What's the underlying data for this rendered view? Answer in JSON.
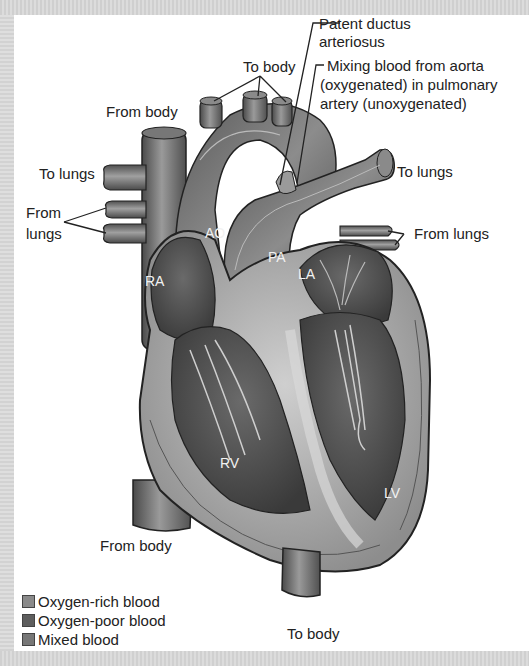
{
  "figure": {
    "title_partial": "Patent Ductus Arteriosus",
    "style": "grayscale anatomical illustration of the heart"
  },
  "labels": {
    "patent_ductus_line1": "Patent ductus",
    "patent_ductus_line2": "arteriosus",
    "mixing_line1": "Mixing blood from aorta",
    "mixing_line2": "(oxygenated) in pulmonary",
    "mixing_line3": "artery (unoxygenated)",
    "to_body_top": "To body",
    "from_body_top": "From body",
    "to_lungs_left": "To lungs",
    "from_lungs_left_line1": "From",
    "from_lungs_left_line2": "lungs",
    "to_lungs_right": "To lungs",
    "from_lungs_right": "From lungs",
    "from_body_bottom": "From body",
    "to_body_bottom": "To body"
  },
  "chambers": {
    "ao": "AO",
    "pa": "PA",
    "ra": "RA",
    "la": "LA",
    "rv": "RV",
    "lv": "LV"
  },
  "legend": {
    "items": [
      {
        "label": "Oxygen-rich blood",
        "color": "#8a8a8a"
      },
      {
        "label": "Oxygen-poor blood",
        "color": "#5e5e5e"
      },
      {
        "label": "Mixed blood",
        "color": "#777777"
      }
    ]
  },
  "colors": {
    "background_panel": "#ffffff",
    "frame": "#d9d9d9",
    "text": "#222222",
    "chamber_text": "#f2f2f2"
  }
}
